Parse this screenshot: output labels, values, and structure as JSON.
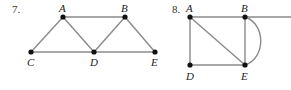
{
  "diagrams": [
    {
      "number": "7.",
      "vertices": [
        {
          "id": "A",
          "label": "A",
          "x": 63,
          "y": 17
        },
        {
          "id": "B",
          "label": "B",
          "x": 125,
          "y": 17
        },
        {
          "id": "C",
          "label": "C",
          "x": 31,
          "y": 52
        },
        {
          "id": "D",
          "label": "D",
          "x": 94,
          "y": 52
        },
        {
          "id": "E",
          "label": "E",
          "x": 155,
          "y": 52
        }
      ],
      "edges": [
        [
          "A",
          "B"
        ],
        [
          "A",
          "C"
        ],
        [
          "A",
          "D"
        ],
        [
          "B",
          "D"
        ],
        [
          "B",
          "E"
        ],
        [
          "C",
          "D"
        ],
        [
          "D",
          "E"
        ]
      ]
    },
    {
      "number": "8.",
      "vertices": [
        {
          "id": "A",
          "label": "A",
          "x": 190,
          "y": 17
        },
        {
          "id": "B",
          "label": "B",
          "x": 245,
          "y": 17
        },
        {
          "id": "D",
          "label": "D",
          "x": 190,
          "y": 65
        },
        {
          "id": "E",
          "label": "E",
          "x": 245,
          "y": 65
        }
      ],
      "edges": [
        [
          "A",
          "B"
        ],
        [
          "A",
          "D"
        ],
        [
          "A",
          "E"
        ],
        [
          "B",
          "E"
        ],
        [
          "D",
          "E"
        ]
      ],
      "curved_edges": [
        [
          "B",
          "E"
        ]
      ],
      "extra_lines": [
        "B extends to right edge"
      ]
    }
  ]
}
